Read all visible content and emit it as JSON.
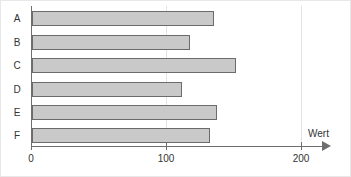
{
  "chart_data": {
    "type": "bar",
    "orientation": "horizontal",
    "title": "",
    "categories": [
      "A",
      "B",
      "C",
      "D",
      "E",
      "F"
    ],
    "values": [
      134,
      116,
      150,
      110,
      136,
      131
    ],
    "xlabel": "Wert",
    "ylabel": "",
    "xlim": [
      0,
      200
    ],
    "xticks": [
      0,
      100,
      200
    ],
    "xtick_labels": [
      "0",
      "100",
      "200"
    ],
    "grid": true,
    "gridlines_at": [
      100,
      200
    ],
    "legend": null,
    "bar_fill_color": "#c9c9c9",
    "bar_border_color": "#6b6b6b",
    "axis_color": "#6e6e6e",
    "grid_color": "#e3e3e3",
    "text_color": "#333333",
    "background_color": "#ffffff",
    "axis_arrow": true
  }
}
